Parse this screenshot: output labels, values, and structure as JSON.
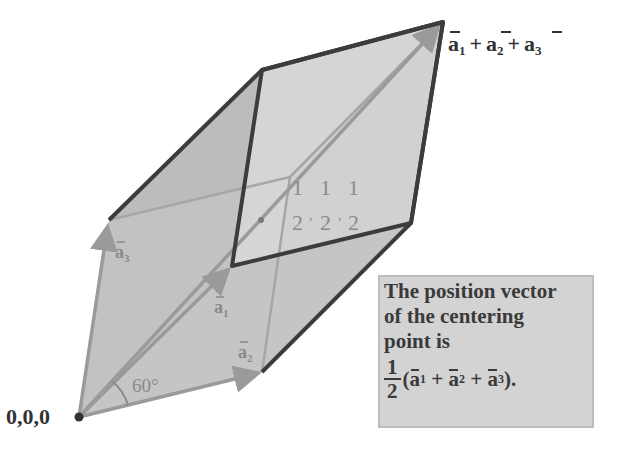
{
  "figure": {
    "colors": {
      "face_fill": "#bdbdbd",
      "top_face_fill": "#d6d6d6",
      "edge_dark": "#3c3c3c",
      "vector_arrow": "#9a9a9a",
      "note_bg": "#d3d3d3",
      "text": "#3a3a3a"
    },
    "labels": {
      "origin": "0,0,0",
      "diagonal_tip": "a1 + a2 + a3",
      "a1": "a",
      "a1_sub": "1",
      "a2": "a",
      "a2_sub": "2",
      "a3": "a",
      "a3_sub": "3",
      "angle": "60°",
      "center_coord_num": [
        "1",
        "1",
        "1"
      ],
      "center_coord_den": [
        "2",
        "2",
        "2"
      ]
    },
    "diagonal_parts": [
      {
        "base": "a",
        "sub": "1"
      },
      {
        "op": "+"
      },
      {
        "base": "a",
        "sub": "2"
      },
      {
        "op": "+"
      },
      {
        "base": "a",
        "sub": "3"
      }
    ]
  },
  "note": {
    "line1": "The position vector",
    "line2": "of the centering",
    "line3": "point is",
    "frac_num": "1",
    "frac_den": "2",
    "open": "(",
    "a": "a",
    "s1": "1",
    "s2": "2",
    "s3": "3",
    "plus": " + ",
    "close": ")."
  }
}
